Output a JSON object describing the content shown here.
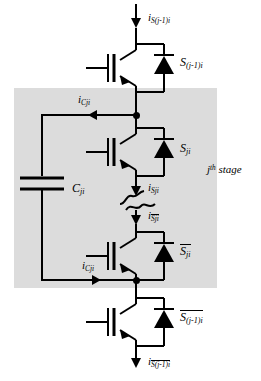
{
  "figure": {
    "type": "circuit-diagram",
    "shaded_region_color": "#dcdcdc",
    "wire_color": "#000000",
    "background": "#ffffff"
  },
  "labels": {
    "current_top": {
      "symbol": "i",
      "subscript": "S(j-1)i",
      "overline": false
    },
    "switch_top": {
      "symbol": "S",
      "subscript": "(j-1)i",
      "overline": false
    },
    "current_cap_upper": {
      "symbol": "i",
      "subscript": "Cji",
      "overline": false
    },
    "switch_second": {
      "symbol": "S",
      "subscript": "ji",
      "overline": false
    },
    "current_second": {
      "symbol": "i",
      "subscript": "Sji",
      "overline": false
    },
    "capacitor": {
      "symbol": "C",
      "subscript": "ji",
      "overline": false
    },
    "stage": {
      "symbol": "j",
      "superscript": "th",
      "text": "stage"
    },
    "current_third": {
      "symbol": "i",
      "subscript": "Sji",
      "overline": true
    },
    "switch_third": {
      "symbol": "S",
      "subscript": "ji",
      "overline": true
    },
    "current_cap_lower": {
      "symbol": "i",
      "subscript": "Cji",
      "overline": false
    },
    "switch_bottom": {
      "symbol": "S",
      "subscript": "(j-1)i",
      "overline": true
    },
    "current_bottom": {
      "symbol": "i",
      "subscript": "S(j-1)i",
      "overline": true
    }
  },
  "components": {
    "switches": [
      {
        "name": "switch-top",
        "label_key": "switch_top"
      },
      {
        "name": "switch-second",
        "label_key": "switch_second"
      },
      {
        "name": "switch-third",
        "label_key": "switch_third"
      },
      {
        "name": "switch-bottom",
        "label_key": "switch_bottom"
      }
    ],
    "capacitor": {
      "name": "flying-capacitor",
      "label_key": "capacitor"
    },
    "nodes": [
      {
        "name": "node-upper-midpoint"
      },
      {
        "name": "node-lower-midpoint"
      }
    ]
  }
}
